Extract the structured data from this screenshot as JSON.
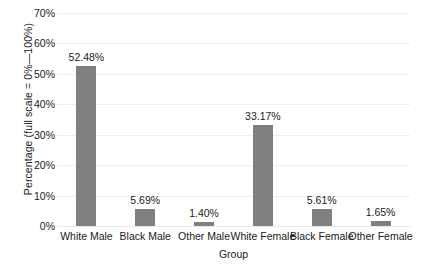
{
  "chart_data": {
    "type": "bar",
    "title": "",
    "xlabel": "Group",
    "ylabel": "Percentage (full scale = 0%—100%)",
    "categories": [
      "White Male",
      "Black Male",
      "Other Male",
      "White Female",
      "Black Female",
      "Other Female"
    ],
    "values": [
      52.48,
      5.69,
      1.4,
      33.17,
      5.61,
      1.65
    ],
    "value_labels": [
      "52.48%",
      "5.69%",
      "1.40%",
      "33.17%",
      "5.61%",
      "1.65%"
    ],
    "ylim": [
      0,
      70
    ],
    "ytick_values": [
      70,
      60,
      50,
      40,
      30,
      20,
      10,
      0
    ],
    "ytick_labels": [
      "70%",
      "60%",
      "50%",
      "40%",
      "30%",
      "20%",
      "10%",
      "0%"
    ],
    "grid": true,
    "legend": "none",
    "bar_color": "#808080",
    "grid_color": "#eceff1",
    "background_color": "#ffffff",
    "text_color": "#1a1a1a"
  }
}
